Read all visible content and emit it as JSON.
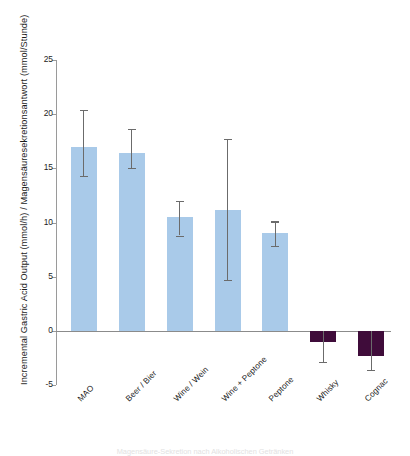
{
  "chart_data": {
    "type": "bar",
    "title": "",
    "xlabel": "",
    "ylabel": "Incremental Gastric Acid Output (mmol/h) / Magensäuresekretionsantwort (mmol/Stunde)",
    "ylim": [
      -5,
      25
    ],
    "yticks": [
      25,
      20,
      15,
      10,
      5,
      0,
      -5
    ],
    "ytick_labels": [
      "25",
      "20",
      "15",
      "10",
      "5",
      "0",
      "-5"
    ],
    "grid": false,
    "legend": "none",
    "categories": [
      "MAO",
      "Beer / Bier",
      "Wine / Wein",
      "Wine + Peptone",
      "Peptone",
      "Whisky",
      "Cognac"
    ],
    "values": [
      17.0,
      16.4,
      10.5,
      11.2,
      9.0,
      -1.0,
      -2.3
    ],
    "error_low": [
      14.3,
      15.0,
      8.8,
      4.7,
      7.8,
      -2.9,
      -3.6
    ],
    "error_high": [
      20.4,
      18.6,
      12.0,
      17.7,
      10.1,
      0.0,
      0.0
    ],
    "bar_colors": [
      "#a9cae9",
      "#a9cae9",
      "#a9cae9",
      "#a9cae9",
      "#a9cae9",
      "#3f0c3a",
      "#3f0c3a"
    ],
    "positive_color": "#a9cae9",
    "negative_color": "#3f0c3a",
    "error_color": "#6b6b6b",
    "axis_color": "#9a9a9a"
  },
  "footnote": "Magensäure-Sekretion nach Alkoholischen Getränken"
}
